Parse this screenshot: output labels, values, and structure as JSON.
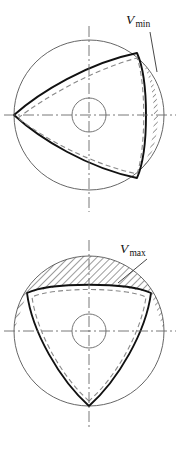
{
  "figure": {
    "panels": [
      {
        "id": "panel-min",
        "name": "minimum-volume-panel",
        "label": {
          "variable": "V",
          "subscript": "min",
          "full": "Vmin"
        },
        "housing": {
          "center_x": 89,
          "center_y": 115,
          "radius": 75
        },
        "hub": {
          "center_x": 89,
          "center_y": 115,
          "radius": 17
        },
        "rotor_orientation_deg": 180,
        "chamber_region": "right crescent between rotor flank and housing",
        "hatched": true
      },
      {
        "id": "panel-max",
        "name": "maximum-volume-panel",
        "label": {
          "variable": "V",
          "subscript": "max",
          "full": "Vmax"
        },
        "housing": {
          "center_x": 89,
          "center_y": 331,
          "radius": 75
        },
        "hub": {
          "center_x": 89,
          "center_y": 331,
          "radius": 17
        },
        "rotor_orientation_deg": 270,
        "chamber_region": "upper segment between rotor flank and housing",
        "hatched": true
      }
    ],
    "colors": {
      "outline": "#111111",
      "thin_line": "#555555",
      "centerline": "#666666",
      "hatch": "#222222",
      "dashed_rotor": "#777777",
      "background": "#ffffff"
    },
    "line_styles": {
      "rotor_solid": "solid heavy",
      "rotor_alternate": "dashed",
      "housing": "thin solid",
      "axes": "dash-dot"
    }
  }
}
